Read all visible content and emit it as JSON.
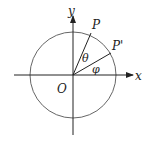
{
  "diagram": {
    "type": "unit-circle-rotation",
    "labels": {
      "y_axis": "y",
      "x_axis": "x",
      "origin": "O",
      "point_p": "P",
      "point_p_prime": "P'",
      "angle_theta": "θ",
      "angle_phi": "φ"
    },
    "colors": {
      "stroke": "#222222",
      "circle": "#555555",
      "background": "#ffffff"
    }
  }
}
